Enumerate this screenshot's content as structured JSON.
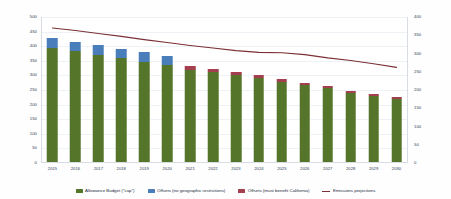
{
  "chart_data": {
    "type": "bar",
    "title": "",
    "subtitle": "",
    "xlabel": "",
    "ylabel": "",
    "y2label": "",
    "ylim": [
      0,
      500
    ],
    "y2lim": [
      0,
      400
    ],
    "grid": true,
    "legend_position": "bottom",
    "stacked": true,
    "categories": [
      "2015",
      "2016",
      "2017",
      "2018",
      "2019",
      "2020",
      "2021",
      "2022",
      "2023",
      "2024",
      "2025",
      "2026",
      "2027",
      "2028",
      "2029",
      "2030"
    ],
    "yticks": [
      0,
      50,
      100,
      150,
      200,
      250,
      300,
      350,
      400,
      450,
      500
    ],
    "y2ticks": [
      0,
      50,
      100,
      150,
      200,
      250,
      300,
      350,
      400
    ],
    "series": [
      {
        "name": "Allowance Budget (\"cap\")",
        "color": "#55752a",
        "type": "bar",
        "axis": "left",
        "values": [
          395,
          382,
          370,
          360,
          347,
          334,
          320,
          312,
          303,
          291,
          279,
          267,
          257,
          240,
          231,
          219
        ]
      },
      {
        "name": "Offsets (no geographic restrictions)",
        "color": "#4a7ebb",
        "type": "bar",
        "axis": "left",
        "values": [
          33,
          33,
          33,
          31,
          32,
          32,
          0,
          0,
          0,
          0,
          0,
          0,
          0,
          0,
          0,
          0
        ]
      },
      {
        "name": "Offsets (must benefit California)",
        "color": "#a33f4e",
        "type": "bar",
        "axis": "left",
        "values": [
          0,
          0,
          0,
          0,
          0,
          0,
          14,
          11,
          10,
          9,
          8,
          8,
          7,
          7,
          6,
          6
        ]
      },
      {
        "name": "Emissions projections",
        "color": "#7b2f34",
        "type": "line",
        "axis": "right",
        "values": [
          370,
          363,
          355,
          347,
          338,
          330,
          322,
          315,
          308,
          303,
          302,
          297,
          288,
          281,
          272,
          262
        ]
      }
    ]
  },
  "legend": {
    "items": [
      {
        "label": "Allowance Budget (\"cap\")",
        "marker": "swatch",
        "color": "#55752a"
      },
      {
        "label": "Offsets (no geographic restrictions)",
        "marker": "swatch",
        "color": "#4a7ebb"
      },
      {
        "label": "Offsets (must benefit California)",
        "marker": "swatch",
        "color": "#a33f4e"
      },
      {
        "label": "Emissions projections",
        "marker": "line",
        "color": "#7b2f34"
      }
    ]
  }
}
